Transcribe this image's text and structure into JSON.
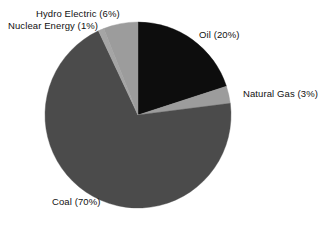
{
  "figure": {
    "background_color": "#ffffff",
    "width": 325,
    "height": 226
  },
  "chart_data": {
    "type": "pie",
    "title": "",
    "subtitle": "",
    "xlabel": "",
    "ylabel": "",
    "legend_position": "none",
    "grid": false,
    "start_angle_deg": 0,
    "direction": "clockwise",
    "center": [
      138,
      115
    ],
    "radius": 93,
    "categories": [
      "Oil",
      "Natural Gas",
      "Coal",
      "Nuclear Energy",
      "Hydro Electric"
    ],
    "values": [
      20,
      3,
      70,
      1,
      6
    ],
    "value_unit": "%",
    "slices": [
      {
        "name": "Oil",
        "value": 20,
        "label": "Oil (20%)",
        "color": "#0d0d0d",
        "start_deg": 0,
        "end_deg": 72
      },
      {
        "name": "Natural Gas",
        "value": 3,
        "label": "Natural Gas (3%)",
        "color": "#9c9c9c",
        "start_deg": 72,
        "end_deg": 82.8
      },
      {
        "name": "Coal",
        "value": 70,
        "label": "Coal (70%)",
        "color": "#4b4b4b",
        "start_deg": 82.8,
        "end_deg": 334.8
      },
      {
        "name": "Nuclear Energy",
        "value": 1,
        "label": "Nuclear Energy (1%)",
        "color": "#a5a5a5",
        "start_deg": 334.8,
        "end_deg": 338.4
      },
      {
        "name": "Hydro Electric",
        "value": 6,
        "label": "Hydro Electric (6%)",
        "color": "#9c9c9c",
        "start_deg": 338.4,
        "end_deg": 360
      }
    ],
    "labels": {
      "hydro": "Hydro Electric (6%)",
      "nuclear": "Nuclear Energy (1%)",
      "oil": "Oil (20%)",
      "natural_gas": "Natural Gas (3%)",
      "coal": "Coal (70%)"
    },
    "colors": {
      "oil": "#0d0d0d",
      "natural_gas": "#9c9c9c",
      "coal": "#4b4b4b",
      "nuclear": "#a5a5a5",
      "hydro": "#9c9c9c",
      "label_text": "#111111",
      "background": "#ffffff"
    }
  }
}
